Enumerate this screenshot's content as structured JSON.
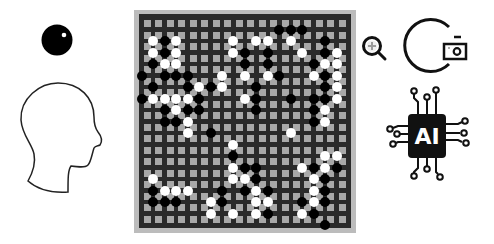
{
  "scene": {
    "description": "Go game illustration: human player vs AI",
    "left": {
      "player_stone": "black-stone-icon",
      "player": "human-head-icon"
    },
    "right": {
      "tools": [
        "zoom-in-icon",
        "arc-icon",
        "camera-icon"
      ],
      "opponent": "ai-chip-icon",
      "ai_label": "AI"
    }
  },
  "board": {
    "size": 19,
    "colors": {
      "frame": "#bcbcbc",
      "board": "#2a2a2a",
      "cell": "#a8a8a8",
      "black": "#000000",
      "white": "#ffffff"
    },
    "stones": [
      {
        "c": 12,
        "r": 1,
        "color": "b"
      },
      {
        "c": 13,
        "r": 1,
        "color": "b"
      },
      {
        "c": 14,
        "r": 1,
        "color": "b"
      },
      {
        "c": 1,
        "r": 2,
        "color": "w"
      },
      {
        "c": 2,
        "r": 2,
        "color": "b"
      },
      {
        "c": 3,
        "r": 2,
        "color": "w"
      },
      {
        "c": 8,
        "r": 2,
        "color": "w"
      },
      {
        "c": 10,
        "r": 2,
        "color": "w"
      },
      {
        "c": 11,
        "r": 2,
        "color": "w"
      },
      {
        "c": 13,
        "r": 2,
        "color": "w"
      },
      {
        "c": 16,
        "r": 2,
        "color": "b"
      },
      {
        "c": 1,
        "r": 3,
        "color": "w"
      },
      {
        "c": 2,
        "r": 3,
        "color": "b"
      },
      {
        "c": 3,
        "r": 3,
        "color": "w"
      },
      {
        "c": 8,
        "r": 3,
        "color": "w"
      },
      {
        "c": 9,
        "r": 3,
        "color": "b"
      },
      {
        "c": 11,
        "r": 3,
        "color": "b"
      },
      {
        "c": 14,
        "r": 3,
        "color": "w"
      },
      {
        "c": 16,
        "r": 3,
        "color": "b"
      },
      {
        "c": 17,
        "r": 3,
        "color": "w"
      },
      {
        "c": 1,
        "r": 4,
        "color": "b"
      },
      {
        "c": 2,
        "r": 4,
        "color": "w"
      },
      {
        "c": 3,
        "r": 4,
        "color": "w"
      },
      {
        "c": 9,
        "r": 4,
        "color": "b"
      },
      {
        "c": 11,
        "r": 4,
        "color": "b"
      },
      {
        "c": 15,
        "r": 4,
        "color": "b"
      },
      {
        "c": 16,
        "r": 4,
        "color": "w"
      },
      {
        "c": 17,
        "r": 4,
        "color": "w"
      },
      {
        "c": 0,
        "r": 5,
        "color": "b"
      },
      {
        "c": 2,
        "r": 5,
        "color": "b"
      },
      {
        "c": 3,
        "r": 5,
        "color": "b"
      },
      {
        "c": 4,
        "r": 5,
        "color": "b"
      },
      {
        "c": 7,
        "r": 5,
        "color": "w"
      },
      {
        "c": 9,
        "r": 5,
        "color": "w"
      },
      {
        "c": 11,
        "r": 5,
        "color": "w"
      },
      {
        "c": 12,
        "r": 5,
        "color": "b"
      },
      {
        "c": 15,
        "r": 5,
        "color": "w"
      },
      {
        "c": 16,
        "r": 5,
        "color": "b"
      },
      {
        "c": 17,
        "r": 5,
        "color": "w"
      },
      {
        "c": 1,
        "r": 6,
        "color": "b"
      },
      {
        "c": 4,
        "r": 6,
        "color": "b"
      },
      {
        "c": 5,
        "r": 6,
        "color": "w"
      },
      {
        "c": 6,
        "r": 6,
        "color": "b"
      },
      {
        "c": 7,
        "r": 6,
        "color": "w"
      },
      {
        "c": 10,
        "r": 6,
        "color": "b"
      },
      {
        "c": 16,
        "r": 6,
        "color": "b"
      },
      {
        "c": 17,
        "r": 6,
        "color": "w"
      },
      {
        "c": 0,
        "r": 7,
        "color": "b"
      },
      {
        "c": 1,
        "r": 7,
        "color": "w"
      },
      {
        "c": 2,
        "r": 7,
        "color": "w"
      },
      {
        "c": 3,
        "r": 7,
        "color": "w"
      },
      {
        "c": 4,
        "r": 7,
        "color": "w"
      },
      {
        "c": 5,
        "r": 7,
        "color": "b"
      },
      {
        "c": 9,
        "r": 7,
        "color": "w"
      },
      {
        "c": 10,
        "r": 7,
        "color": "b"
      },
      {
        "c": 13,
        "r": 7,
        "color": "b"
      },
      {
        "c": 15,
        "r": 7,
        "color": "b"
      },
      {
        "c": 16,
        "r": 7,
        "color": "b"
      },
      {
        "c": 17,
        "r": 7,
        "color": "w"
      },
      {
        "c": 2,
        "r": 8,
        "color": "b"
      },
      {
        "c": 3,
        "r": 8,
        "color": "w"
      },
      {
        "c": 4,
        "r": 8,
        "color": "b"
      },
      {
        "c": 5,
        "r": 8,
        "color": "b"
      },
      {
        "c": 10,
        "r": 8,
        "color": "b"
      },
      {
        "c": 15,
        "r": 8,
        "color": "b"
      },
      {
        "c": 16,
        "r": 8,
        "color": "w"
      },
      {
        "c": 2,
        "r": 9,
        "color": "b"
      },
      {
        "c": 3,
        "r": 9,
        "color": "b"
      },
      {
        "c": 4,
        "r": 9,
        "color": "w"
      },
      {
        "c": 15,
        "r": 9,
        "color": "b"
      },
      {
        "c": 16,
        "r": 9,
        "color": "w"
      },
      {
        "c": 4,
        "r": 10,
        "color": "w"
      },
      {
        "c": 6,
        "r": 10,
        "color": "b"
      },
      {
        "c": 13,
        "r": 10,
        "color": "w"
      },
      {
        "c": 8,
        "r": 11,
        "color": "w"
      },
      {
        "c": 8,
        "r": 12,
        "color": "b"
      },
      {
        "c": 16,
        "r": 12,
        "color": "w"
      },
      {
        "c": 17,
        "r": 12,
        "color": "w"
      },
      {
        "c": 8,
        "r": 13,
        "color": "w"
      },
      {
        "c": 9,
        "r": 13,
        "color": "b"
      },
      {
        "c": 10,
        "r": 13,
        "color": "b"
      },
      {
        "c": 14,
        "r": 13,
        "color": "w"
      },
      {
        "c": 15,
        "r": 13,
        "color": "b"
      },
      {
        "c": 16,
        "r": 13,
        "color": "w"
      },
      {
        "c": 17,
        "r": 13,
        "color": "b"
      },
      {
        "c": 1,
        "r": 14,
        "color": "w"
      },
      {
        "c": 8,
        "r": 14,
        "color": "w"
      },
      {
        "c": 9,
        "r": 14,
        "color": "w"
      },
      {
        "c": 10,
        "r": 14,
        "color": "b"
      },
      {
        "c": 15,
        "r": 14,
        "color": "w"
      },
      {
        "c": 16,
        "r": 14,
        "color": "b"
      },
      {
        "c": 1,
        "r": 15,
        "color": "b"
      },
      {
        "c": 2,
        "r": 15,
        "color": "w"
      },
      {
        "c": 3,
        "r": 15,
        "color": "w"
      },
      {
        "c": 4,
        "r": 15,
        "color": "w"
      },
      {
        "c": 7,
        "r": 15,
        "color": "b"
      },
      {
        "c": 9,
        "r": 15,
        "color": "b"
      },
      {
        "c": 10,
        "r": 15,
        "color": "w"
      },
      {
        "c": 11,
        "r": 15,
        "color": "b"
      },
      {
        "c": 15,
        "r": 15,
        "color": "w"
      },
      {
        "c": 16,
        "r": 15,
        "color": "b"
      },
      {
        "c": 1,
        "r": 16,
        "color": "b"
      },
      {
        "c": 2,
        "r": 16,
        "color": "b"
      },
      {
        "c": 3,
        "r": 16,
        "color": "b"
      },
      {
        "c": 6,
        "r": 16,
        "color": "w"
      },
      {
        "c": 7,
        "r": 16,
        "color": "b"
      },
      {
        "c": 10,
        "r": 16,
        "color": "w"
      },
      {
        "c": 11,
        "r": 16,
        "color": "w"
      },
      {
        "c": 14,
        "r": 16,
        "color": "b"
      },
      {
        "c": 15,
        "r": 16,
        "color": "w"
      },
      {
        "c": 16,
        "r": 16,
        "color": "b"
      },
      {
        "c": 6,
        "r": 17,
        "color": "w"
      },
      {
        "c": 8,
        "r": 17,
        "color": "w"
      },
      {
        "c": 10,
        "r": 17,
        "color": "w"
      },
      {
        "c": 11,
        "r": 17,
        "color": "b"
      },
      {
        "c": 14,
        "r": 17,
        "color": "w"
      },
      {
        "c": 15,
        "r": 17,
        "color": "b"
      },
      {
        "c": 16,
        "r": 18,
        "color": "b"
      }
    ]
  }
}
